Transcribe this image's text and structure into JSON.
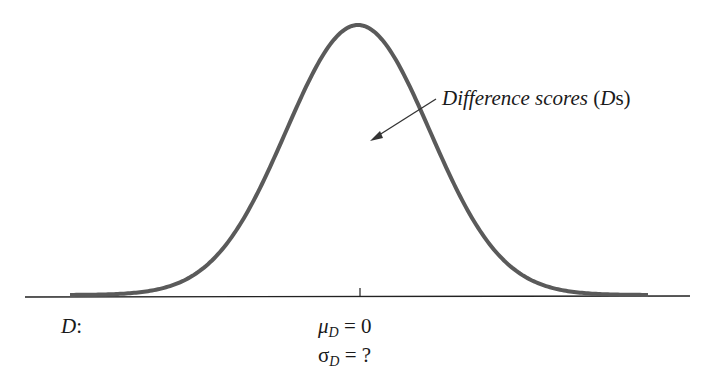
{
  "figure": {
    "curve_label": {
      "text_italic": "Difference scores",
      "paren_open": " (",
      "paren_var": "D",
      "paren_rest": "s)"
    },
    "axis_label": "D",
    "axis_label_suffix": ":",
    "mean": {
      "symbol": "μ",
      "subscript": "D",
      "rest": " = 0"
    },
    "sd": {
      "symbol": "σ",
      "subscript": "D",
      "rest": " = ?"
    },
    "colors": {
      "curve": "#5a5a5a",
      "axis": "#222222"
    }
  },
  "chart_data": {
    "type": "line",
    "title": "",
    "xlabel": "D",
    "annotations": [
      "Difference scores (Ds)",
      "μD = 0",
      "σD = ?"
    ],
    "center": 0,
    "mean": 0,
    "sd": "?",
    "grid": false
  }
}
